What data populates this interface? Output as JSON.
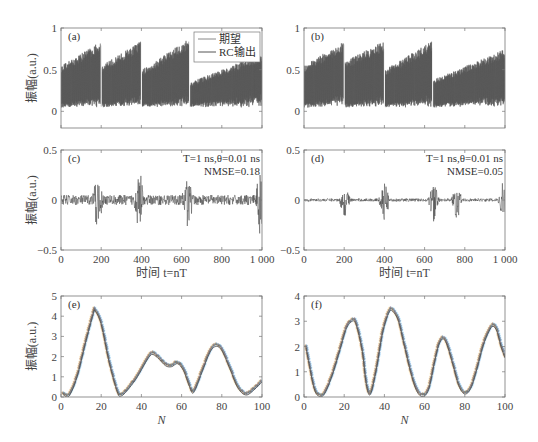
{
  "chart_data": [
    {
      "id": "a",
      "type": "line",
      "panel_label": "(a)",
      "ylabel": "振幅(a.u.)",
      "xlabel": "",
      "xlim": [
        0,
        1000
      ],
      "ylim": [
        -0.2,
        1
      ],
      "yticks": [
        0,
        0.5,
        1
      ],
      "ytick_labels": [
        "0",
        "0.5",
        "1"
      ],
      "xticks": [
        0,
        200,
        400,
        600,
        800,
        1000
      ],
      "xtick_labels": [],
      "legend": {
        "position": "upper right",
        "entries": [
          "期望",
          "RC输出"
        ]
      },
      "series": [
        {
          "name": "期望",
          "color": "#888888"
        },
        {
          "name": "RC输出",
          "color": "#555555"
        }
      ],
      "segments": [
        {
          "x_start": 0,
          "x_end": 200,
          "peak_start": 0.55,
          "peak_end": 0.85,
          "base": 0.05
        },
        {
          "x_start": 200,
          "x_end": 400,
          "peak_start": 0.55,
          "peak_end": 0.85,
          "base": 0.05
        },
        {
          "x_start": 400,
          "x_end": 640,
          "peak_start": 0.5,
          "peak_end": 0.88,
          "base": 0.05
        },
        {
          "x_start": 640,
          "x_end": 1000,
          "peak_start": 0.35,
          "peak_end": 0.7,
          "base": 0.05
        }
      ],
      "description": "Sawtooth-envelope oscillating signal; target and RC output overlap; 1000 time steps"
    },
    {
      "id": "b",
      "type": "line",
      "panel_label": "(b)",
      "ylabel": "",
      "xlabel": "",
      "xlim": [
        0,
        1000
      ],
      "ylim": [
        -0.2,
        1
      ],
      "yticks": [
        0,
        0.5,
        1
      ],
      "ytick_labels": [
        "0",
        "0.5",
        "1"
      ],
      "xticks": [
        0,
        200,
        400,
        600,
        800,
        1000
      ],
      "xtick_labels": [],
      "series": [
        {
          "name": "期望",
          "color": "#888888"
        },
        {
          "name": "RC输出",
          "color": "#555555"
        }
      ],
      "segments": [
        {
          "x_start": 0,
          "x_end": 200,
          "peak_start": 0.55,
          "peak_end": 0.85,
          "base": 0.05
        },
        {
          "x_start": 200,
          "x_end": 400,
          "peak_start": 0.6,
          "peak_end": 0.85,
          "base": 0.05
        },
        {
          "x_start": 400,
          "x_end": 640,
          "peak_start": 0.5,
          "peak_end": 0.85,
          "base": 0.05
        },
        {
          "x_start": 640,
          "x_end": 1000,
          "peak_start": 0.38,
          "peak_end": 0.75,
          "base": 0.05
        }
      ]
    },
    {
      "id": "c",
      "type": "line",
      "panel_label": "(c)",
      "ylabel": "振幅(a.u.)",
      "xlabel": "时间 t=nT",
      "xlim": [
        0,
        1000
      ],
      "ylim": [
        -0.5,
        0.5
      ],
      "yticks": [
        -0.5,
        0,
        0.5
      ],
      "ytick_labels": [
        "−0.5",
        "0",
        "0.5"
      ],
      "xticks": [
        0,
        200,
        400,
        600,
        800,
        1000
      ],
      "xtick_labels": [
        "0",
        "200",
        "400",
        "600",
        "800",
        "1 000"
      ],
      "annotations": [
        "T=1 ns,θ=0.01 ns",
        "NMSE=0.18"
      ],
      "series": [
        {
          "name": "error",
          "color": "#444444",
          "noise_amp": 0.05,
          "spike_amp": 0.3,
          "spikes_at": [
            180,
            390,
            630,
            990
          ]
        }
      ]
    },
    {
      "id": "d",
      "type": "line",
      "panel_label": "(d)",
      "ylabel": "",
      "xlabel": "时间 t=nT",
      "xlim": [
        0,
        1000
      ],
      "ylim": [
        -0.5,
        0.5
      ],
      "yticks": [
        -0.5,
        0,
        0.5
      ],
      "ytick_labels": [
        "−0.5",
        "0",
        "0.5"
      ],
      "xticks": [
        0,
        200,
        400,
        600,
        800,
        1000
      ],
      "xtick_labels": [
        "0",
        "200",
        "400",
        "600",
        "800",
        "1 000"
      ],
      "annotations": [
        "T=1 ns,θ=0.01 ns",
        "NMSE=0.05"
      ],
      "series": [
        {
          "name": "error",
          "color": "#444444",
          "noise_amp": 0.015,
          "spike_amp": 0.2,
          "spikes_at": [
            205,
            400,
            645,
            760,
            990
          ]
        }
      ]
    },
    {
      "id": "e",
      "type": "line",
      "panel_label": "(e)",
      "ylabel": "振幅(a.u.)",
      "xlabel": "N",
      "xlim": [
        0,
        100
      ],
      "ylim": [
        0,
        5
      ],
      "yticks": [
        0,
        1,
        2,
        3,
        4,
        5
      ],
      "ytick_labels": [
        "0",
        "1",
        "2",
        "3",
        "4",
        "5"
      ],
      "xticks": [
        0,
        20,
        40,
        60,
        80,
        100
      ],
      "xtick_labels": [
        "0",
        "20",
        "40",
        "60",
        "80",
        "100"
      ],
      "marker": "*",
      "x": [
        1,
        4,
        8,
        12,
        16,
        17,
        20,
        24,
        28,
        30,
        34,
        38,
        42,
        45,
        48,
        52,
        55,
        58,
        61,
        64,
        66,
        70,
        74,
        77,
        80,
        84,
        88,
        92,
        96,
        100
      ],
      "values": [
        0.12,
        0.05,
        1.0,
        2.6,
        4.1,
        4.25,
        3.6,
        1.7,
        0.25,
        0.05,
        0.45,
        1.0,
        1.7,
        2.1,
        1.95,
        1.55,
        1.5,
        1.65,
        1.3,
        0.5,
        0.22,
        1.2,
        2.2,
        2.5,
        2.3,
        1.4,
        0.45,
        0.1,
        0.35,
        0.75
      ]
    },
    {
      "id": "f",
      "type": "line",
      "panel_label": "(f)",
      "ylabel": "",
      "xlabel": "N",
      "xlim": [
        0,
        100
      ],
      "ylim": [
        0,
        4
      ],
      "yticks": [
        0,
        1,
        2,
        3,
        4
      ],
      "ytick_labels": [
        "0",
        "1",
        "2",
        "3",
        "4"
      ],
      "xticks": [
        0,
        20,
        40,
        60,
        80,
        100
      ],
      "xtick_labels": [
        "0",
        "20",
        "40",
        "60",
        "80",
        "100"
      ],
      "marker": "*",
      "x": [
        1,
        3,
        5,
        7,
        10,
        14,
        18,
        21,
        24,
        26,
        29,
        31,
        33,
        36,
        39,
        42,
        44,
        47,
        50,
        53,
        56,
        59,
        62,
        65,
        67,
        69,
        71,
        74,
        77,
        80,
        83,
        86,
        89,
        92,
        94,
        96,
        98,
        100
      ],
      "values": [
        1.95,
        1.1,
        0.35,
        0.05,
        0.1,
        0.85,
        1.9,
        2.7,
        3.0,
        2.85,
        1.8,
        0.5,
        0.1,
        1.1,
        2.5,
        3.3,
        3.4,
        3.0,
        2.0,
        1.0,
        0.25,
        0.02,
        0.3,
        1.4,
        2.05,
        2.3,
        2.1,
        1.3,
        0.45,
        0.12,
        0.35,
        1.1,
        2.0,
        2.6,
        2.8,
        2.6,
        2.0,
        1.55
      ]
    }
  ]
}
